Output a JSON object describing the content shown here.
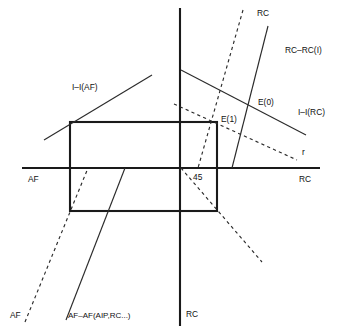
{
  "figure": {
    "title": "",
    "type": "economic-schematic-diagram",
    "width": 337,
    "height": 334,
    "background": "#ffffff",
    "ink_color": "#1a1a1a",
    "line_color": "#2b2b2b"
  },
  "axes": {
    "horizontal": {
      "left_label": "AF",
      "right_label": "RC",
      "y": 168,
      "x_start": 22,
      "x_end": 320
    },
    "vertical": {
      "top_label": "",
      "bottom_label": "RC",
      "x": 180,
      "y_start": 8,
      "y_end": 326
    }
  },
  "labels": [
    {
      "id": "axis-af-left",
      "text": "AF",
      "x": 28,
      "y": 180
    },
    {
      "id": "axis-rc-right",
      "text": "RC",
      "x": 305,
      "y": 180
    },
    {
      "id": "axis-rc-bottom",
      "text": "RC",
      "x": 186,
      "y": 315
    },
    {
      "id": "angle-45",
      "text": "45",
      "x": 193,
      "y": 178
    },
    {
      "id": "line-ii-af",
      "text": "I–I(AF)",
      "x": 72,
      "y": 88
    },
    {
      "id": "line-rc-top",
      "text": "RC",
      "x": 257,
      "y": 14
    },
    {
      "id": "line-rc-rc-i",
      "text": "RC–RC(I)",
      "x": 285,
      "y": 51
    },
    {
      "id": "line-ii-rc",
      "text": "I–I(RC)",
      "x": 298,
      "y": 113
    },
    {
      "id": "point-e0",
      "text": "E(0)",
      "x": 258,
      "y": 103
    },
    {
      "id": "point-e1",
      "text": "E(1)",
      "x": 221,
      "y": 120
    },
    {
      "id": "line-r",
      "text": "r",
      "x": 302,
      "y": 153
    },
    {
      "id": "line-af-bottom",
      "text": "AF",
      "x": 10,
      "y": 316
    },
    {
      "id": "line-af-af-aip-rc",
      "text": "AF–AF(AIP,RC...)",
      "x": 68,
      "y": 316
    }
  ],
  "shapes": {
    "rectangle": {
      "name": "equilibrium-box",
      "x1": 70,
      "y1": 122,
      "x2": 217,
      "y2": 211
    }
  },
  "lines": [
    {
      "id": "ii-af-curve",
      "style": "solid",
      "label": "I–I(AF)",
      "points": "44,140 152,75"
    },
    {
      "id": "ii-rc-curve",
      "style": "solid",
      "label": "I–I(RC)",
      "points": "181,70 306,135"
    },
    {
      "id": "rc-rc-i-line",
      "style": "solid",
      "label": "RC–RC(I)",
      "points": "268,26 232,168"
    },
    {
      "id": "rc-dashed-top",
      "style": "dashed",
      "label": "RC",
      "points": "243,10 198,168"
    },
    {
      "id": "r-dashed",
      "style": "dashed",
      "label": "r",
      "points": "174,104 297,160"
    },
    {
      "id": "diag-dashed-down",
      "style": "dashed",
      "label": "45-diagonal",
      "points": "181,168 262,262"
    },
    {
      "id": "af-dashed-left",
      "style": "dashed",
      "label": "AF",
      "points": "25,322 88,168"
    },
    {
      "id": "af-af-solid",
      "style": "solid",
      "label": "AF–AF(AIP,RC...)",
      "points": "66,320 125,168"
    }
  ]
}
